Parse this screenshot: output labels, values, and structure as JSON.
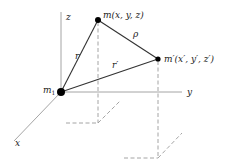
{
  "diagram": {
    "axes": {
      "x": "x",
      "y": "y",
      "z": "z"
    },
    "points": {
      "origin": {
        "label": "m",
        "subscript": "1"
      },
      "m": {
        "label": "m(x,  y,  z)"
      },
      "m_prime": {
        "label": "m′(x′,  y′,  z′)"
      }
    },
    "segments": {
      "r": "r",
      "r_prime": "r′",
      "rho": "ρ"
    },
    "colors": {
      "line": "#333333",
      "axis": "#9a9a9a",
      "point": "#000000"
    }
  }
}
